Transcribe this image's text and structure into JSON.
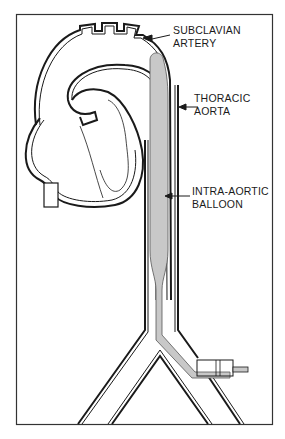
{
  "diagram": {
    "type": "anatomical illustration",
    "colors": {
      "line": "#1a1a1a",
      "balloon_fill": "#c8c8c8",
      "background": "#ffffff"
    },
    "labels": [
      {
        "id": "subclavian",
        "line1": "SUBCLAVIAN",
        "line2": "ARTERY"
      },
      {
        "id": "thoracic",
        "line1": "THORACIC",
        "line2": "AORTA"
      },
      {
        "id": "balloon",
        "line1": "INTRA-AORTIC",
        "line2": "BALLOON"
      }
    ]
  }
}
